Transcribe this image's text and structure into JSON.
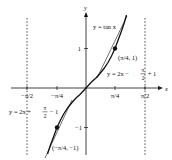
{
  "figure": {
    "type": "function-graph-with-tangents",
    "function_label": "y = tan x",
    "axes": {
      "x_label": "x",
      "y_label": "y",
      "x_ticks": [
        "−π/2",
        "−π/4",
        "π/4",
        "π/2"
      ],
      "y_ticks": [
        "1",
        "−1"
      ]
    },
    "asymptotes": [
      "x = −π/2",
      "x = π/2"
    ],
    "points": [
      {
        "label": "(π/4, 1)"
      },
      {
        "label": "(−π/4, −1)"
      }
    ],
    "tangent_lines": [
      {
        "label_prefix": "y = 2x − ",
        "frac_num": "π",
        "frac_den": "2",
        "label_suffix": " + 1"
      },
      {
        "label_prefix": "y = 2x + ",
        "frac_num": "π",
        "frac_den": "2",
        "label_suffix": " − 1"
      }
    ]
  },
  "colors": {
    "curve": "#111111",
    "axis": "#111111",
    "asymptote": "#333333",
    "background": "#ffffff"
  }
}
